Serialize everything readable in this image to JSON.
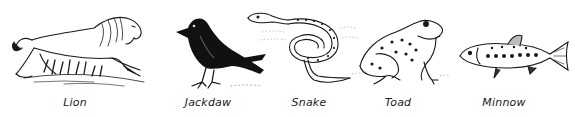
{
  "plate": {
    "animals": [
      {
        "name": "Lion",
        "icon": "lion-icon",
        "label_x": 75
      },
      {
        "name": "Jackdaw",
        "icon": "jackdaw-icon",
        "label_x": 208
      },
      {
        "name": "Snake",
        "icon": "snake-icon",
        "label_x": 309
      },
      {
        "name": "Toad",
        "icon": "toad-icon",
        "label_x": 398
      },
      {
        "name": "Minnow",
        "icon": "minnow-icon",
        "label_x": 504
      }
    ]
  },
  "colors": {
    "ink": "#1a1a1a",
    "paper": "#ffffff",
    "label": "#222222"
  }
}
